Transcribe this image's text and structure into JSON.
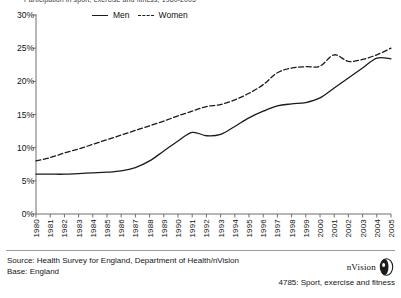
{
  "figure": {
    "clipped_title": "Participation in sport, exercise and fitness, 1980-2005"
  },
  "legend": {
    "position": "top-center",
    "items": [
      {
        "label": "Men",
        "style": "solid",
        "swatch": "line-solid-swatch"
      },
      {
        "label": "Women",
        "style": "dashed",
        "swatch": "line-dashed-swatch"
      }
    ]
  },
  "footer": {
    "source": "Source: Health Survey for England, Department of Health/nVision",
    "base": "Base: England"
  },
  "brand": {
    "name": "nVision",
    "logo_icon": "nvision-leaf-logo-icon",
    "reference": "4785: Sport, exercise and fitness"
  },
  "colors": {
    "line": "#1a1a1a",
    "axis": "#6e6e6e",
    "text": "#111111",
    "background": "#ffffff"
  },
  "chart_data": {
    "type": "line",
    "title": "",
    "xlabel": "",
    "ylabel": "",
    "grid": false,
    "legend_position": "top-center",
    "ylim": [
      0,
      30
    ],
    "yticks": [
      0,
      5,
      10,
      15,
      20,
      25,
      30
    ],
    "ytick_labels": [
      "0%",
      "5%",
      "10%",
      "15%",
      "20%",
      "25%",
      "30%"
    ],
    "xlim": [
      1980,
      2005
    ],
    "x": [
      1980,
      1981,
      1982,
      1983,
      1984,
      1985,
      1986,
      1987,
      1988,
      1989,
      1990,
      1991,
      1992,
      1993,
      1994,
      1995,
      1996,
      1997,
      1998,
      1999,
      2000,
      2001,
      2002,
      2003,
      2004,
      2005
    ],
    "categories": [
      "1980",
      "1981",
      "1982",
      "1983",
      "1984",
      "1985",
      "1986",
      "1987",
      "1988",
      "1989",
      "1990",
      "1991",
      "1992",
      "1993",
      "1994",
      "1995",
      "1996",
      "1997",
      "1998",
      "1999",
      "2000",
      "2001",
      "2002",
      "2003",
      "2004",
      "2005"
    ],
    "series": [
      {
        "name": "Men",
        "style": "solid",
        "values": [
          6.0,
          6.0,
          6.0,
          6.1,
          6.2,
          6.3,
          6.5,
          7.0,
          8.0,
          9.5,
          11.0,
          12.3,
          11.8,
          12.0,
          13.2,
          14.5,
          15.5,
          16.3,
          16.6,
          16.8,
          17.5,
          19.0,
          20.5,
          22.0,
          23.5,
          23.4
        ]
      },
      {
        "name": "Women",
        "style": "dashed",
        "values": [
          8.0,
          8.5,
          9.2,
          9.8,
          10.5,
          11.2,
          11.9,
          12.6,
          13.3,
          14.0,
          14.8,
          15.5,
          16.2,
          16.5,
          17.2,
          18.2,
          19.5,
          21.3,
          22.0,
          22.2,
          22.3,
          24.0,
          23.0,
          23.3,
          24.0,
          25.0
        ]
      }
    ]
  }
}
